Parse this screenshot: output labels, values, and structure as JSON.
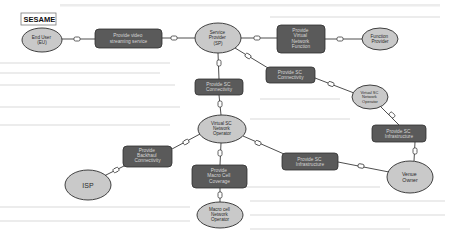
{
  "diagram": {
    "title_label": "SESAME",
    "actors": {
      "end_user": {
        "lines": [
          "End User",
          "(EU)"
        ]
      },
      "service_provider": {
        "lines": [
          "Service",
          "Provider",
          "(SP)"
        ]
      },
      "function_provider": {
        "lines": [
          "Function",
          "Provider"
        ]
      },
      "vsc_operator_right": {
        "lines": [
          "Virtual SC",
          "Network",
          "Operator"
        ]
      },
      "vsc_operator_center": {
        "lines": [
          "Virtual SC",
          "Network",
          "Operator"
        ]
      },
      "isp": {
        "lines": [
          "ISP"
        ]
      },
      "macro_cell_operator": {
        "lines": [
          "Macro cell",
          "Network",
          "Operator"
        ]
      },
      "venue_owner": {
        "lines": [
          "Venue",
          "Owner"
        ]
      }
    },
    "services": {
      "video_streaming": {
        "lines": [
          "Provide video",
          "streaming service"
        ]
      },
      "virtual_network_function": {
        "lines": [
          "Provide",
          "Virtual",
          "Network",
          "Function"
        ]
      },
      "sc_connectivity_left": {
        "lines": [
          "Provide SC",
          "Connectivity"
        ]
      },
      "sc_connectivity_right": {
        "lines": [
          "Provide SC",
          "Connectivity"
        ]
      },
      "sc_infrastructure_right": {
        "lines": [
          "Provide SC",
          "Infrastructure"
        ]
      },
      "sc_infrastructure_mid": {
        "lines": [
          "Provide SC",
          "Infrastructure"
        ]
      },
      "backhaul_connectivity": {
        "lines": [
          "Provide",
          "Backhaul",
          "Connectivity"
        ]
      },
      "macro_cell_coverage": {
        "lines": [
          "Provide",
          "Macro Cell",
          "Coverage"
        ]
      }
    }
  },
  "colors": {
    "actor_fill": "#c9c9c9",
    "service_fill": "#5a5a5a",
    "service_text": "#d6d6d6",
    "outline": "#2e2e2e",
    "background": "#ffffff"
  }
}
